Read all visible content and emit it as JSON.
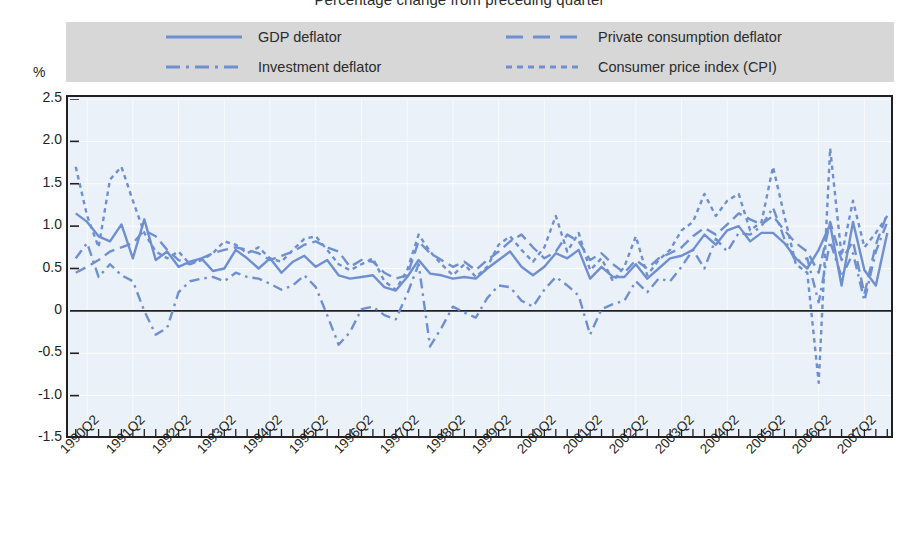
{
  "title": "Percentage change from preceding quarter",
  "axis": {
    "y_unit": "%",
    "y_ticks": [
      "2.5",
      "2.0",
      "1.5",
      "1.0",
      "0.5",
      "0",
      "-0.5",
      "-1.0",
      "-1.5"
    ],
    "x_ticks": [
      "1990Q2",
      "1991Q2",
      "1992Q2",
      "1993Q2",
      "1994Q2",
      "1995Q2",
      "1996Q2",
      "1997Q2",
      "1998Q2",
      "1999Q2",
      "2000Q2",
      "2001Q2",
      "2002Q2",
      "2003Q2",
      "2004Q2",
      "2005Q2",
      "2006Q2",
      "2007Q2"
    ]
  },
  "legend": {
    "items": [
      {
        "label": "GDP deflator",
        "style": "solid",
        "swatch": "legend-swatch-gdp"
      },
      {
        "label": "Private consumption deflator",
        "style": "dashed",
        "swatch": "legend-swatch-private"
      },
      {
        "label": "Investment deflator",
        "style": "dashdot",
        "swatch": "legend-swatch-investment"
      },
      {
        "label": "Consumer price index (CPI)",
        "style": "dotted",
        "swatch": "legend-swatch-cpi"
      }
    ]
  },
  "colors": {
    "line": "#6f8fd0",
    "plot_background": "#eaf1f8",
    "grid": "#ffffff",
    "frame": "#231f20",
    "legend_background": "#d7d7d7",
    "text": "#231f20"
  },
  "chart_data": {
    "type": "line",
    "title": "Percentage change from preceding quarter",
    "xlabel": "",
    "ylabel": "%",
    "ylim": [
      -1.5,
      2.5
    ],
    "ytick_values": [
      2.5,
      2.0,
      1.5,
      1.0,
      0.5,
      0,
      -0.5,
      -1.0,
      -1.5
    ],
    "grid": true,
    "legend_position": "top",
    "x": [
      "1990Q1",
      "1990Q2",
      "1990Q3",
      "1990Q4",
      "1991Q1",
      "1991Q2",
      "1991Q3",
      "1991Q4",
      "1992Q1",
      "1992Q2",
      "1992Q3",
      "1992Q4",
      "1993Q1",
      "1993Q2",
      "1993Q3",
      "1993Q4",
      "1994Q1",
      "1994Q2",
      "1994Q3",
      "1994Q4",
      "1995Q1",
      "1995Q2",
      "1995Q3",
      "1995Q4",
      "1996Q1",
      "1996Q2",
      "1996Q3",
      "1996Q4",
      "1997Q1",
      "1997Q2",
      "1997Q3",
      "1997Q4",
      "1998Q1",
      "1998Q2",
      "1998Q3",
      "1998Q4",
      "1999Q1",
      "1999Q2",
      "1999Q3",
      "1999Q4",
      "2000Q1",
      "2000Q2",
      "2000Q3",
      "2000Q4",
      "2001Q1",
      "2001Q2",
      "2001Q3",
      "2001Q4",
      "2002Q1",
      "2002Q2",
      "2002Q3",
      "2002Q4",
      "2003Q1",
      "2003Q2",
      "2003Q3",
      "2003Q4",
      "2004Q1",
      "2004Q2",
      "2004Q3",
      "2004Q4",
      "2005Q1",
      "2005Q2",
      "2005Q3",
      "2005Q4",
      "2006Q1",
      "2006Q2",
      "2006Q3",
      "2006Q4",
      "2007Q1",
      "2007Q2",
      "2007Q3",
      "2007Q4"
    ],
    "series": [
      {
        "name": "GDP deflator",
        "style": "solid",
        "color": "#6f8fd0",
        "values": [
          1.15,
          1.05,
          0.88,
          0.82,
          1.02,
          0.62,
          1.08,
          0.6,
          0.7,
          0.52,
          0.58,
          0.62,
          0.47,
          0.5,
          0.72,
          0.62,
          0.5,
          0.62,
          0.45,
          0.58,
          0.65,
          0.52,
          0.6,
          0.42,
          0.38,
          0.4,
          0.42,
          0.28,
          0.24,
          0.4,
          0.6,
          0.44,
          0.42,
          0.38,
          0.4,
          0.38,
          0.5,
          0.6,
          0.7,
          0.52,
          0.42,
          0.52,
          0.68,
          0.62,
          0.72,
          0.38,
          0.52,
          0.4,
          0.4,
          0.55,
          0.38,
          0.5,
          0.62,
          0.65,
          0.72,
          0.9,
          0.78,
          0.95,
          1.0,
          0.82,
          0.92,
          0.92,
          0.8,
          0.62,
          0.5,
          0.72,
          1.02,
          0.3,
          1.05,
          0.48,
          0.3,
          0.92
        ]
      },
      {
        "name": "Private consumption deflator",
        "style": "dashed",
        "color": "#6f8fd0",
        "values": [
          0.45,
          0.52,
          0.6,
          0.7,
          0.75,
          0.8,
          0.95,
          0.88,
          0.72,
          0.6,
          0.55,
          0.62,
          0.68,
          0.72,
          0.75,
          0.72,
          0.68,
          0.6,
          0.65,
          0.7,
          0.78,
          0.82,
          0.75,
          0.7,
          0.52,
          0.6,
          0.58,
          0.45,
          0.38,
          0.42,
          0.82,
          0.68,
          0.6,
          0.52,
          0.58,
          0.48,
          0.6,
          0.7,
          0.82,
          0.9,
          0.75,
          0.62,
          0.7,
          0.9,
          0.82,
          0.6,
          0.68,
          0.55,
          0.45,
          0.6,
          0.5,
          0.62,
          0.68,
          0.75,
          0.88,
          0.98,
          0.9,
          1.02,
          1.15,
          1.08,
          1.02,
          1.12,
          0.95,
          0.8,
          0.7,
          0.45,
          1.05,
          0.6,
          0.82,
          0.2,
          0.78,
          1.15
        ]
      },
      {
        "name": "Investment deflator",
        "style": "dashdot",
        "color": "#6f8fd0",
        "values": [
          0.62,
          0.8,
          0.4,
          0.55,
          0.42,
          0.35,
          0.0,
          -0.28,
          -0.2,
          0.22,
          0.35,
          0.38,
          0.4,
          0.35,
          0.45,
          0.4,
          0.38,
          0.32,
          0.25,
          0.3,
          0.42,
          0.28,
          -0.05,
          -0.4,
          -0.25,
          0.02,
          0.05,
          -0.05,
          -0.1,
          0.2,
          0.55,
          -0.42,
          -0.2,
          0.05,
          -0.02,
          -0.08,
          0.15,
          0.3,
          0.28,
          0.12,
          0.05,
          0.25,
          0.4,
          0.3,
          0.18,
          -0.28,
          0.02,
          0.08,
          0.12,
          0.35,
          0.22,
          0.38,
          0.35,
          0.52,
          0.72,
          0.5,
          0.85,
          0.7,
          0.92,
          0.9,
          1.0,
          1.22,
          0.85,
          0.58,
          0.62,
          0.1,
          0.82,
          0.4,
          0.68,
          0.12,
          0.7,
          1.05
        ]
      },
      {
        "name": "Consumer price index (CPI)",
        "style": "dotted",
        "color": "#6f8fd0",
        "values": [
          1.7,
          1.12,
          0.75,
          1.55,
          1.7,
          1.3,
          0.92,
          0.7,
          0.62,
          0.7,
          0.55,
          0.6,
          0.68,
          0.82,
          0.78,
          0.68,
          0.75,
          0.62,
          0.58,
          0.72,
          0.85,
          0.88,
          0.72,
          0.55,
          0.48,
          0.55,
          0.62,
          0.35,
          0.25,
          0.48,
          0.9,
          0.7,
          0.55,
          0.42,
          0.55,
          0.4,
          0.52,
          0.78,
          0.88,
          0.72,
          0.58,
          0.75,
          1.12,
          0.7,
          0.92,
          0.48,
          0.62,
          0.35,
          0.52,
          0.88,
          0.42,
          0.6,
          0.72,
          0.95,
          1.05,
          1.38,
          1.12,
          1.3,
          1.38,
          0.95,
          1.05,
          1.7,
          1.12,
          0.55,
          0.45,
          -0.85,
          1.92,
          0.65,
          1.3,
          0.75,
          0.92,
          1.12
        ]
      }
    ]
  }
}
